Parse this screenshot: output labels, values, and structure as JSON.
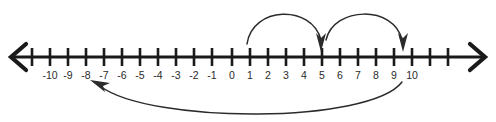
{
  "figure": {
    "background_color": "#ffffff",
    "line_color": "#1a1a1a",
    "arc_color": "#2b2b2b",
    "label_color": "#2b2b2b"
  },
  "number_line": {
    "axis_y": 57,
    "tick_spacing": 18,
    "origin_x": 250,
    "tick_top": 48,
    "tick_bottom": 66,
    "label_y": 79,
    "min_value": -11,
    "max_value": 11,
    "left_arrow": {
      "tip_x": 10,
      "name": "left-arrowhead"
    },
    "right_arrow": {
      "tip_x": 486,
      "name": "right-arrowhead"
    },
    "ticks": [
      {
        "value": -11,
        "x": 32,
        "label": ""
      },
      {
        "value": -10,
        "x": 50,
        "label": "-10"
      },
      {
        "value": -9,
        "x": 68,
        "label": "-9"
      },
      {
        "value": -8,
        "x": 86,
        "label": "-8"
      },
      {
        "value": -7,
        "x": 104,
        "label": "-7"
      },
      {
        "value": -6,
        "x": 122,
        "label": "-6"
      },
      {
        "value": -5,
        "x": 140,
        "label": "-5"
      },
      {
        "value": -4,
        "x": 158,
        "label": "-4"
      },
      {
        "value": -3,
        "x": 176,
        "label": "-3"
      },
      {
        "value": -2,
        "x": 194,
        "label": "-2"
      },
      {
        "value": -1,
        "x": 212,
        "label": "-1"
      },
      {
        "value": 0,
        "x": 250,
        "label": "0"
      },
      {
        "value": 1,
        "x": 268,
        "label": "1"
      },
      {
        "value": 2,
        "x": 286,
        "label": "2"
      },
      {
        "value": 3,
        "x": 304,
        "label": "3"
      },
      {
        "value": 4,
        "x": 322,
        "label": "4"
      },
      {
        "value": 5,
        "x": 340,
        "label": "5"
      },
      {
        "value": 6,
        "x": 358,
        "label": "6"
      },
      {
        "value": 7,
        "x": 376,
        "label": "7"
      },
      {
        "value": 8,
        "x": 394,
        "label": "8"
      },
      {
        "value": 9,
        "x": 412,
        "label": "9"
      },
      {
        "value": 10,
        "x": 430,
        "label": "10"
      },
      {
        "value": 11,
        "x": 448,
        "label": ""
      }
    ],
    "unlabeled_tick_x": [
      232
    ]
  },
  "arcs": {
    "hop_1": {
      "name": "jump-arc-0-to-4",
      "from_value": 0,
      "to_value": 4,
      "direction": "right",
      "path": "M 247 44 C 252 6, 312 4, 321 40",
      "head": "M 321 52 L 316 33 L 321 38 L 326 33 Z"
    },
    "hop_2": {
      "name": "jump-arc-4-to-8",
      "from_value": 4,
      "to_value": 8,
      "direction": "right",
      "path": "M 326 40 C 334 6, 394 5, 402 40",
      "head": "M 403 52 L 398 33 L 403 38 L 408 33 Z"
    },
    "return": {
      "name": "return-arc-8-to-minus-8",
      "from_value": 8,
      "to_value": -8,
      "direction": "left",
      "path": "M 402 82 C 370 124, 150 124, 100 86",
      "head": "M 90 80 L 110 83 L 103 86 L 105 92 Z"
    }
  },
  "labels": {
    "tick_labels": [
      "-10",
      "-9",
      "-8",
      "-7",
      "-6",
      "-5",
      "-4",
      "-3",
      "-2",
      "-1",
      "0",
      "1",
      "2",
      "3",
      "4",
      "5",
      "6",
      "7",
      "8",
      "9",
      "10"
    ]
  }
}
